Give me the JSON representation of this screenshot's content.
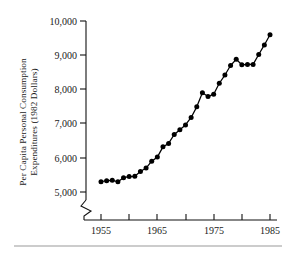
{
  "chart_data": {
    "type": "line",
    "title": "",
    "subtitle": "",
    "xlabel": "",
    "ylabel": "Per Capita Personal Consumption Expenditures (1982 Dollars)",
    "ylabel_line1": "Per Capita Personal Consumption",
    "ylabel_line2": "Expenditures (1982 Dollars)",
    "grid": false,
    "legend": "none",
    "marker": "filled-circle",
    "axis_break": true,
    "axis_break_note": "y-axis broken below 5,000",
    "xlim": [
      1954,
      1986
    ],
    "ylim": [
      5000,
      10000
    ],
    "ytick_values": [
      5000,
      6000,
      7000,
      8000,
      9000,
      10000
    ],
    "ytick_labels": [
      "5,000",
      "6,000",
      "7,000",
      "8,000",
      "9,000",
      "10,000"
    ],
    "xtick_values": [
      1955,
      1960,
      1965,
      1970,
      1975,
      1980,
      1985
    ],
    "xtick_labels": [
      "1955",
      "",
      "1965",
      "",
      "1975",
      "",
      "1985"
    ],
    "x": [
      1955,
      1956,
      1957,
      1958,
      1959,
      1960,
      1961,
      1962,
      1963,
      1964,
      1965,
      1966,
      1967,
      1968,
      1969,
      1970,
      1971,
      1972,
      1973,
      1974,
      1975,
      1976,
      1977,
      1978,
      1979,
      1980,
      1981,
      1982,
      1983,
      1984,
      1985
    ],
    "values": [
      5300,
      5330,
      5340,
      5300,
      5420,
      5450,
      5460,
      5600,
      5700,
      5900,
      6020,
      6320,
      6420,
      6680,
      6820,
      6960,
      7180,
      7490,
      7900,
      7790,
      7860,
      8180,
      8420,
      8700,
      8880,
      8720,
      8730,
      8730,
      9020,
      9300,
      9600
    ],
    "series": [
      {
        "name": "Per Capita Personal Consumption Expenditures",
        "values": [
          5300,
          5330,
          5340,
          5300,
          5420,
          5450,
          5460,
          5600,
          5700,
          5900,
          6020,
          6320,
          6420,
          6680,
          6820,
          6960,
          7180,
          7490,
          7900,
          7790,
          7860,
          8180,
          8420,
          8700,
          8880,
          8720,
          8730,
          8730,
          9020,
          9300,
          9600
        ]
      }
    ]
  },
  "style": {
    "line_color": "#000000",
    "marker_color": "#000000",
    "axis_color": "#111111",
    "text_color": "#1a1a1a",
    "background": "#ffffff",
    "rule_color": "#9a9a9a"
  }
}
